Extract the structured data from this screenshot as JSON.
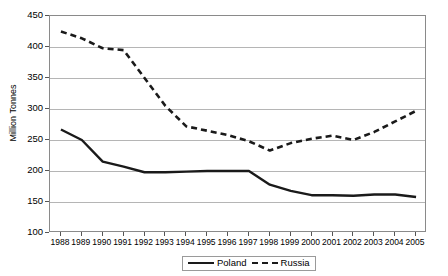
{
  "chart_data": {
    "type": "line",
    "title": "",
    "xlabel": "",
    "ylabel": "Million Tonnes",
    "ylim": [
      100,
      450
    ],
    "ytick_labels": [
      "450",
      "400",
      "350",
      "300",
      "250",
      "200",
      "150",
      "100"
    ],
    "ytick_values": [
      450,
      400,
      350,
      300,
      250,
      200,
      150,
      100
    ],
    "grid": true,
    "legend_position": "bottom-center",
    "categories": [
      "1988",
      "1989",
      "1990",
      "1991",
      "1992",
      "1993",
      "1994",
      "1995",
      "1996",
      "1997",
      "1998",
      "1999",
      "2000",
      "2001",
      "2002",
      "2003",
      "2004",
      "2005"
    ],
    "x": [
      1988,
      1989,
      1990,
      1991,
      1992,
      1993,
      1994,
      1995,
      1996,
      1997,
      1998,
      1999,
      2000,
      2001,
      2002,
      2003,
      2004,
      2005
    ],
    "series": [
      {
        "name": "Poland",
        "style": "solid",
        "color": "#1a1a1a",
        "values": [
          267,
          250,
          215,
          207,
          198,
          198,
          199,
          200,
          200,
          200,
          178,
          168,
          161,
          161,
          160,
          162,
          162,
          158
        ]
      },
      {
        "name": "Russia",
        "style": "dashed",
        "color": "#1a1a1a",
        "values": [
          425,
          414,
          398,
          395,
          350,
          305,
          272,
          265,
          258,
          248,
          233,
          245,
          252,
          257,
          250,
          263,
          280,
          297
        ]
      }
    ]
  },
  "legend": {
    "items": [
      {
        "label": "Poland",
        "style": "solid"
      },
      {
        "label": "Russia",
        "style": "dashed"
      }
    ]
  },
  "axis": {
    "y_title": "Million Tonnes"
  }
}
